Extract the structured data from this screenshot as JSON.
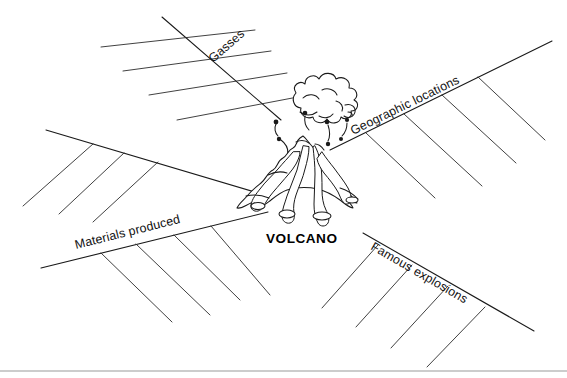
{
  "worksheet": {
    "title": "VOLCANO",
    "center_label": "VOLCANO",
    "artwork_name": "volcano-illustration",
    "ink_color": "#1a1a1a",
    "paper_color": "#ffffff",
    "footer_rule_color": "#9a9a9a",
    "branches": [
      {
        "id": "gasses",
        "label": "Gasses",
        "direction": "upper-left",
        "blank_lines": 4
      },
      {
        "id": "geographic-locations",
        "label": "Geographic locations",
        "direction": "upper-right",
        "blank_lines": 4
      },
      {
        "id": "materials-produced",
        "label": "Materials produced",
        "direction": "lower-left",
        "blank_lines": 4
      },
      {
        "id": "famous-explosions",
        "label": "Famous explosions",
        "direction": "lower-right",
        "blank_lines": 4
      }
    ]
  }
}
